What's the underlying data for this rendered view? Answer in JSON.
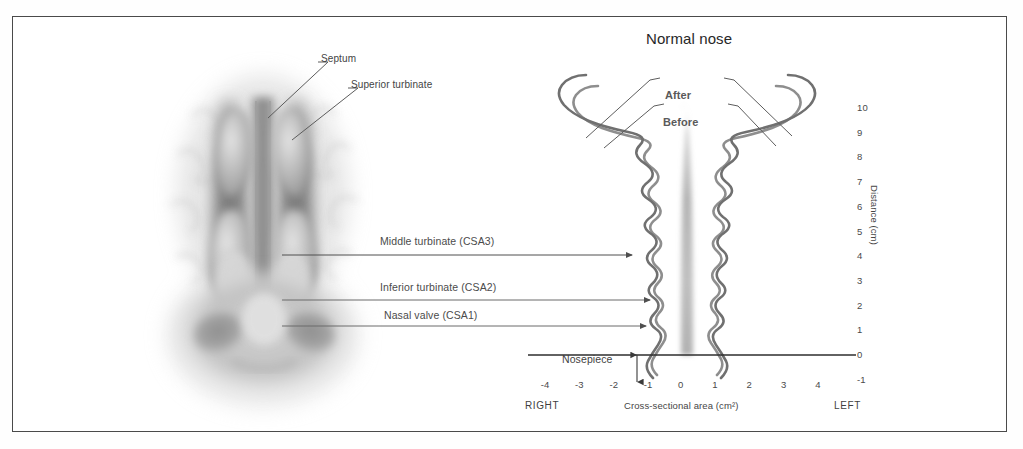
{
  "figure": {
    "title": "Normal nose",
    "background_color": "#ffffff",
    "border_color": "#4a4a4a"
  },
  "anatomy": {
    "description": "coronal grayscale illustration of nasal cavity",
    "labels": [
      {
        "text": "Septum",
        "target": "nasal septum"
      },
      {
        "text": "Superior turbinate",
        "target": "superior turbinate"
      }
    ]
  },
  "callouts": [
    {
      "text": "Middle turbinate (CSA3)",
      "csa": "CSA3"
    },
    {
      "text": "Inferior turbinate (CSA2)",
      "csa": "CSA2"
    },
    {
      "text": "Nasal valve (CSA1)",
      "csa": "CSA1"
    }
  ],
  "annotations": {
    "nosepiece": "Nosepiece",
    "after": "After",
    "before": "Before"
  },
  "chart_data": {
    "type": "line",
    "title": "Normal nose",
    "xlabel": "Cross-sectional area (cm²)",
    "ylabel": "Distance (cm)",
    "xlim": [
      -4.6,
      4.6
    ],
    "ylim": [
      -1,
      10.4
    ],
    "grid": false,
    "legend_position": "inline-callout",
    "x_ticks": [
      "-4",
      "-3",
      "-2",
      "-1",
      "0",
      "1",
      "2",
      "3",
      "4"
    ],
    "x_tick_values": [
      -4,
      -3,
      -2,
      -1,
      0,
      1,
      2,
      3,
      4
    ],
    "y_ticks": [
      "10",
      "9",
      "8",
      "7",
      "6",
      "5",
      "4",
      "3",
      "2",
      "1",
      "0",
      "-1"
    ],
    "y_tick_values": [
      10,
      9,
      8,
      7,
      6,
      5,
      4,
      3,
      2,
      1,
      0,
      -1
    ],
    "side_labels": {
      "left_of_axis": "RIGHT",
      "right_of_axis": "LEFT"
    },
    "baseline_y": 0,
    "series": [
      {
        "name": "Before",
        "side": "right-nasal-cavity",
        "points": [
          {
            "distance": -0.6,
            "area": -0.75
          },
          {
            "distance": -0.2,
            "area": -1.05
          },
          {
            "distance": 0.2,
            "area": -0.72
          },
          {
            "distance": 0.7,
            "area": -0.95
          },
          {
            "distance": 1.2,
            "area": -0.7
          },
          {
            "distance": 1.8,
            "area": -1.1
          },
          {
            "distance": 2.4,
            "area": -0.8
          },
          {
            "distance": 3.0,
            "area": -1.25
          },
          {
            "distance": 3.6,
            "area": -0.85
          },
          {
            "distance": 4.3,
            "area": -1.3
          },
          {
            "distance": 5.0,
            "area": -0.9
          },
          {
            "distance": 5.8,
            "area": -1.35
          },
          {
            "distance": 6.6,
            "area": -1.0
          },
          {
            "distance": 7.4,
            "area": -1.5
          },
          {
            "distance": 8.0,
            "area": -1.8
          },
          {
            "distance": 8.5,
            "area": -2.6
          },
          {
            "distance": 9.0,
            "area": -3.0
          },
          {
            "distance": 9.4,
            "area": -2.9
          },
          {
            "distance": 9.8,
            "area": -2.2
          },
          {
            "distance": 10.1,
            "area": -1.2
          }
        ]
      },
      {
        "name": "After",
        "side": "right-nasal-cavity",
        "points": [
          {
            "distance": -0.6,
            "area": -0.9
          },
          {
            "distance": -0.2,
            "area": -1.18
          },
          {
            "distance": 0.2,
            "area": -0.85
          },
          {
            "distance": 0.7,
            "area": -1.08
          },
          {
            "distance": 1.2,
            "area": -0.83
          },
          {
            "distance": 1.8,
            "area": -1.25
          },
          {
            "distance": 2.4,
            "area": -0.92
          },
          {
            "distance": 3.0,
            "area": -1.4
          },
          {
            "distance": 3.6,
            "area": -0.98
          },
          {
            "distance": 4.3,
            "area": -1.45
          },
          {
            "distance": 5.0,
            "area": -1.05
          },
          {
            "distance": 5.8,
            "area": -1.5
          },
          {
            "distance": 6.6,
            "area": -1.15
          },
          {
            "distance": 7.4,
            "area": -1.65
          },
          {
            "distance": 8.0,
            "area": -2.0
          },
          {
            "distance": 8.5,
            "area": -2.8
          },
          {
            "distance": 9.0,
            "area": -3.2
          },
          {
            "distance": 9.4,
            "area": -3.1
          },
          {
            "distance": 9.8,
            "area": -2.35
          },
          {
            "distance": 10.15,
            "area": -1.3
          }
        ]
      },
      {
        "name": "Before",
        "side": "left-nasal-cavity",
        "mirror_of": "Before",
        "points": [
          {
            "distance": -0.6,
            "area": 0.75
          },
          {
            "distance": -0.2,
            "area": 1.05
          },
          {
            "distance": 0.2,
            "area": 0.72
          },
          {
            "distance": 0.7,
            "area": 0.95
          },
          {
            "distance": 1.2,
            "area": 0.7
          },
          {
            "distance": 1.8,
            "area": 1.1
          },
          {
            "distance": 2.4,
            "area": 0.8
          },
          {
            "distance": 3.0,
            "area": 1.25
          },
          {
            "distance": 3.6,
            "area": 0.85
          },
          {
            "distance": 4.3,
            "area": 1.3
          },
          {
            "distance": 5.0,
            "area": 0.9
          },
          {
            "distance": 5.8,
            "area": 1.35
          },
          {
            "distance": 6.6,
            "area": 1.0
          },
          {
            "distance": 7.4,
            "area": 1.5
          },
          {
            "distance": 8.0,
            "area": 1.8
          },
          {
            "distance": 8.5,
            "area": 2.6
          },
          {
            "distance": 9.0,
            "area": 3.0
          },
          {
            "distance": 9.4,
            "area": 2.9
          },
          {
            "distance": 9.8,
            "area": 2.2
          },
          {
            "distance": 10.1,
            "area": 1.2
          }
        ]
      },
      {
        "name": "After",
        "side": "left-nasal-cavity",
        "mirror_of": "After",
        "points": [
          {
            "distance": -0.6,
            "area": 0.9
          },
          {
            "distance": -0.2,
            "area": 1.18
          },
          {
            "distance": 0.2,
            "area": 0.85
          },
          {
            "distance": 0.7,
            "area": 1.08
          },
          {
            "distance": 1.2,
            "area": 0.83
          },
          {
            "distance": 1.8,
            "area": 1.25
          },
          {
            "distance": 2.4,
            "area": 0.92
          },
          {
            "distance": 3.0,
            "area": 1.4
          },
          {
            "distance": 3.6,
            "area": 0.98
          },
          {
            "distance": 4.3,
            "area": 1.45
          },
          {
            "distance": 5.0,
            "area": 1.05
          },
          {
            "distance": 5.8,
            "area": 1.5
          },
          {
            "distance": 6.6,
            "area": 1.15
          },
          {
            "distance": 7.4,
            "area": 1.65
          },
          {
            "distance": 8.0,
            "area": 2.0
          },
          {
            "distance": 8.5,
            "area": 2.8
          },
          {
            "distance": 9.0,
            "area": 3.2
          },
          {
            "distance": 9.4,
            "area": 3.1
          },
          {
            "distance": 9.8,
            "area": 2.35
          },
          {
            "distance": 10.15,
            "area": 1.3
          }
        ]
      }
    ]
  }
}
